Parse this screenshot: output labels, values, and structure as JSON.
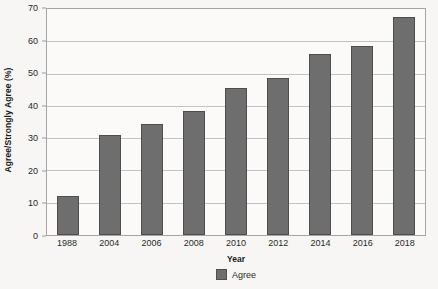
{
  "chart_data": {
    "type": "bar",
    "title": "",
    "subtitle": "",
    "xlabel": "Year",
    "ylabel": "Agree/Strongly Agree (%)",
    "categories": [
      "1988",
      "2004",
      "2006",
      "2008",
      "2010",
      "2012",
      "2014",
      "2016",
      "2018"
    ],
    "values": [
      12,
      31,
      34.5,
      38.5,
      45.5,
      48.5,
      56,
      58.5,
      67.5
    ],
    "series": [
      {
        "name": "Agree",
        "values": [
          12,
          31,
          34.5,
          38.5,
          45.5,
          48.5,
          56,
          58.5,
          67.5
        ],
        "color": "#6e6e6e"
      }
    ],
    "ylim": [
      0,
      70
    ],
    "ytick_labels": [
      "0",
      "10",
      "20",
      "30",
      "40",
      "50",
      "60",
      "70"
    ],
    "ytick_values": [
      0,
      10,
      20,
      30,
      40,
      50,
      60,
      70
    ],
    "grid": true,
    "legend": {
      "position": "bottom",
      "entries": [
        {
          "label": "Agree",
          "color": "#6e6e6e"
        }
      ]
    },
    "colors": {
      "bar": "#6e6e6e",
      "bar_border": "#4e4e4e",
      "gridline": "#c3c3c3",
      "axis_border": "#a5a5a5",
      "background": "#f7f6f4",
      "plot_background": "#fbfaf9",
      "text": "#2a2a2a"
    }
  }
}
